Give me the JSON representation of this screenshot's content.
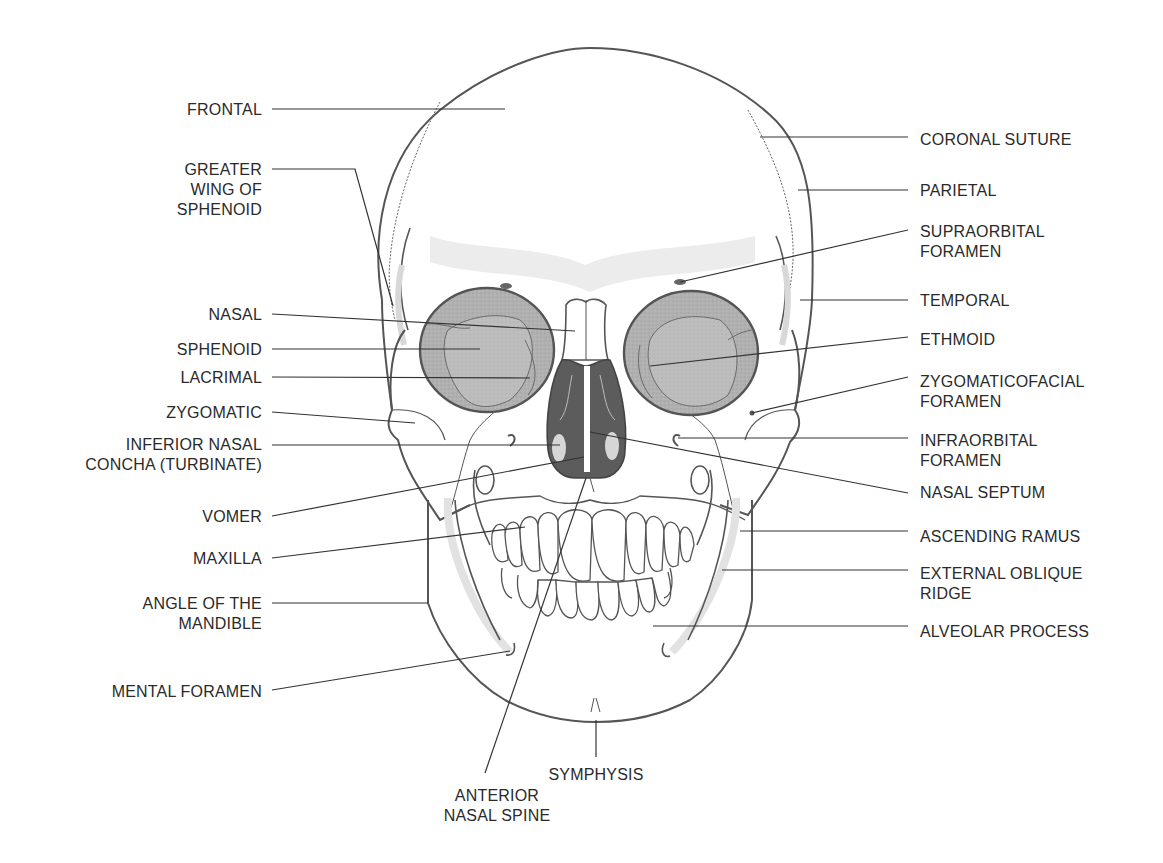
{
  "figure": {
    "colors": {
      "outline": "#555555",
      "leader": "#333333",
      "text": "#2a2a2a",
      "orbit_fill": "#a9a9a9",
      "orbit_inner": "#b9b9b9",
      "nasal_cavity": "#5c5c5c",
      "light_shade": "#e4e4e4",
      "bone": "#ffffff"
    }
  },
  "labels_left": [
    {
      "id": "frontal",
      "text": "FRONTAL",
      "x": 262,
      "y": 100,
      "line": [
        [
          272,
          109
        ],
        [
          505,
          109
        ]
      ]
    },
    {
      "id": "greater-wing-of-sphenoid",
      "text": "GREATER\nWING OF\nSPHENOID",
      "x": 262,
      "y": 160,
      "line": [
        [
          272,
          169
        ],
        [
          355,
          169
        ],
        [
          393,
          306
        ]
      ]
    },
    {
      "id": "nasal",
      "text": "NASAL",
      "x": 262,
      "y": 305,
      "line": [
        [
          272,
          314
        ],
        [
          575,
          331
        ]
      ]
    },
    {
      "id": "sphenoid",
      "text": "SPHENOID",
      "x": 262,
      "y": 340,
      "line": [
        [
          272,
          349
        ],
        [
          480,
          349
        ]
      ]
    },
    {
      "id": "lacrimal",
      "text": "LACRIMAL",
      "x": 262,
      "y": 368,
      "line": [
        [
          272,
          377
        ],
        [
          530,
          378
        ]
      ]
    },
    {
      "id": "zygomatic",
      "text": "ZYGOMATIC",
      "x": 262,
      "y": 403,
      "line": [
        [
          272,
          412
        ],
        [
          415,
          423
        ]
      ]
    },
    {
      "id": "inferior-nasal-concha",
      "text": "INFERIOR NASAL\nCONCHA (TURBINATE)",
      "x": 262,
      "y": 435,
      "line": [
        [
          272,
          445
        ],
        [
          560,
          445
        ]
      ]
    },
    {
      "id": "vomer",
      "text": "VOMER",
      "x": 262,
      "y": 507,
      "line": [
        [
          272,
          516
        ],
        [
          584,
          457
        ]
      ]
    },
    {
      "id": "maxilla",
      "text": "MAXILLA",
      "x": 262,
      "y": 549,
      "line": [
        [
          272,
          558
        ],
        [
          525,
          527
        ]
      ]
    },
    {
      "id": "angle-of-mandible",
      "text": "ANGLE OF THE\nMANDIBLE",
      "x": 262,
      "y": 594,
      "line": [
        [
          272,
          603
        ],
        [
          428,
          603
        ]
      ]
    },
    {
      "id": "mental-foramen",
      "text": "MENTAL FORAMEN",
      "x": 262,
      "y": 682,
      "line": [
        [
          272,
          690
        ],
        [
          510,
          651
        ]
      ]
    }
  ],
  "labels_right": [
    {
      "id": "coronal-suture",
      "text": "CORONAL SUTURE",
      "x": 920,
      "y": 130,
      "line": [
        [
          760,
          137
        ],
        [
          908,
          137
        ]
      ]
    },
    {
      "id": "parietal",
      "text": "PARIETAL",
      "x": 920,
      "y": 181,
      "line": [
        [
          798,
          190
        ],
        [
          908,
          190
        ]
      ]
    },
    {
      "id": "supraorbital-foramen",
      "text": "SUPRAORBITAL\nFORAMEN",
      "x": 920,
      "y": 222,
      "line": [
        [
          908,
          230
        ],
        [
          680,
          282
        ]
      ]
    },
    {
      "id": "temporal",
      "text": "TEMPORAL",
      "x": 920,
      "y": 291,
      "line": [
        [
          800,
          300
        ],
        [
          908,
          300
        ]
      ]
    },
    {
      "id": "ethmoid",
      "text": "ETHMOID",
      "x": 920,
      "y": 330,
      "line": [
        [
          908,
          337
        ],
        [
          650,
          366
        ]
      ]
    },
    {
      "id": "zygomaticofacial-foramen",
      "text": "ZYGOMATICOFACIAL\nFORAMEN",
      "x": 920,
      "y": 372,
      "line": [
        [
          908,
          377
        ],
        [
          752,
          413
        ]
      ]
    },
    {
      "id": "infraorbital-foramen",
      "text": "INFRAORBITAL\nFORAMEN",
      "x": 920,
      "y": 431,
      "line": [
        [
          678,
          438
        ],
        [
          908,
          438
        ]
      ]
    },
    {
      "id": "nasal-septum",
      "text": "NASAL SEPTUM",
      "x": 920,
      "y": 483,
      "line": [
        [
          590,
          432
        ],
        [
          908,
          493
        ]
      ]
    },
    {
      "id": "ascending-ramus",
      "text": "ASCENDING RAMUS",
      "x": 920,
      "y": 527,
      "line": [
        [
          740,
          531
        ],
        [
          908,
          531
        ]
      ]
    },
    {
      "id": "external-oblique-ridge",
      "text": "EXTERNAL OBLIQUE\nRIDGE",
      "x": 920,
      "y": 564,
      "line": [
        [
          722,
          570
        ],
        [
          908,
          570
        ]
      ]
    },
    {
      "id": "alveolar-process",
      "text": "ALVEOLAR PROCESS",
      "x": 920,
      "y": 622,
      "line": [
        [
          653,
          626
        ],
        [
          908,
          626
        ]
      ]
    }
  ],
  "labels_bottom": [
    {
      "id": "symphysis",
      "text": "SYMPHYSIS",
      "x": 596,
      "y": 765,
      "line": [
        [
          596,
          720
        ],
        [
          596,
          757
        ]
      ]
    },
    {
      "id": "anterior-nasal-spine",
      "text": "ANTERIOR\nNASAL SPINE",
      "x": 497,
      "y": 786,
      "line": [
        [
          586,
          478
        ],
        [
          485,
          773
        ]
      ]
    }
  ]
}
